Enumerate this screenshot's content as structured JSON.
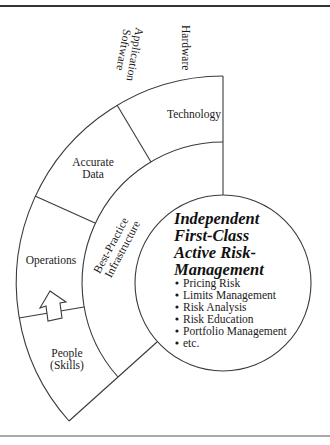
{
  "diagram": {
    "outer_ring": {
      "top_labels": {
        "application_software_line1": "Application",
        "application_software_line2": "Software",
        "hardware": "Hardware"
      },
      "segments": [
        {
          "id": "technology",
          "lines": [
            "Technology"
          ]
        },
        {
          "id": "accurate-data",
          "lines": [
            "Accurate",
            "Data"
          ]
        },
        {
          "id": "operations",
          "lines": [
            "Operations"
          ]
        },
        {
          "id": "people",
          "lines": [
            "People",
            "(Skills)"
          ]
        }
      ],
      "arrow_icon": "up-arrow-icon"
    },
    "middle_ring": {
      "label_line1": "Best-Practice",
      "label_line2": "Infrastructure"
    },
    "core": {
      "title_lines": [
        "Independent",
        "First-Class",
        "Active Risk-",
        "Management"
      ],
      "bullets": [
        "Pricing Risk",
        "Limits Management",
        "Risk Analysis",
        "Risk Education",
        "Portfolio Management",
        "etc."
      ]
    }
  },
  "colors": {
    "line": "#3a3a3a",
    "text": "#1a1a1a",
    "background": "#ffffff"
  }
}
